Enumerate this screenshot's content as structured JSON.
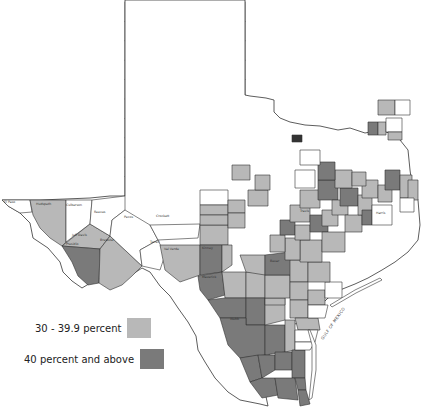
{
  "map": {
    "region": "Texas",
    "unit": "counties",
    "colors": {
      "none": "#ffffff",
      "mid": "#b8b8b8",
      "high": "#7a7a7a",
      "border": "#333333"
    },
    "water_label": "GULF OF MEXICO",
    "panhandle_grid": [
      [
        "Dallam",
        "Sherman",
        "Hansford",
        "Ochiltree",
        "Lipscomb"
      ],
      [
        "Hartley",
        "Moore",
        "Hutchinson",
        "Roberts",
        "Hemphill"
      ],
      [
        "Oldham",
        "Potter",
        "Carson",
        "Gray",
        "Wheeler"
      ],
      [
        "Deaf Smith",
        "Randall",
        "Armstrong",
        "Donley",
        "Collingsworth"
      ],
      [
        "Parmer",
        "Castro",
        "Swisher",
        "Briscoe",
        "Hall",
        "Childress"
      ],
      [
        "Bailey",
        "Lamb",
        "Hale",
        "Floyd",
        "Motley",
        "Cottle"
      ],
      [
        "Cochran",
        "Hockley",
        "Lubbock",
        "Crosby",
        "Dickens",
        "King",
        "Knox"
      ],
      [
        "Yoakum",
        "Terry",
        "Lynn",
        "Garza",
        "Kent",
        "Stonewall",
        "Haskell"
      ],
      [
        "Gaines",
        "Dawson",
        "Borden",
        "Scurry",
        "Fisher",
        "Jones",
        "Shackelford",
        "Stephens"
      ],
      [
        "Andrews",
        "Martin",
        "Howard",
        "Mitchell",
        "Nolan",
        "Taylor",
        "Callahan",
        "Eastland"
      ]
    ],
    "labeled_counties": [
      "El Paso",
      "Hudspeth",
      "Culberson",
      "Jeff Davis",
      "Presidio",
      "Brewster",
      "Reeves",
      "Pecos",
      "Terrell",
      "Crockett",
      "Val Verde",
      "Edwards",
      "Kinney",
      "Uvalde",
      "Maverick",
      "Zavala",
      "Dimmit",
      "Webb",
      "La Salle",
      "Zapata",
      "Jim Hogg",
      "Starr",
      "Hidalgo",
      "Cameron",
      "Willacy",
      "Kenedy",
      "Brooks",
      "Duval",
      "Jim Wells",
      "Kleberg",
      "Nueces",
      "San Patricio",
      "Frio",
      "Medina",
      "Bexar",
      "Atascosa",
      "McMullen",
      "Live Oak",
      "Bee",
      "Goliad",
      "Karnes",
      "Wilson",
      "Gonzales",
      "DeWitt",
      "Victoria",
      "Calhoun",
      "Refugio",
      "Aransas",
      "Jackson",
      "Matagorda",
      "Wharton",
      "Brazoria",
      "Galveston",
      "Harris",
      "Fort Bend",
      "Austin",
      "Waller",
      "Montgomery",
      "Liberty",
      "Chambers",
      "Jefferson",
      "Orange",
      "Hardin",
      "Newton",
      "Jasper",
      "Tyler",
      "Polk",
      "San Jacinto",
      "Walker",
      "Grimes",
      "Brazos",
      "Burleson",
      "Washington",
      "Lee",
      "Fayette",
      "Bastrop",
      "Caldwell",
      "Travis",
      "Hays",
      "Comal",
      "Guadalupe",
      "Kendall",
      "Kerr",
      "Bandera",
      "Real",
      "Sutton",
      "Schleicher",
      "Kimble",
      "Menard",
      "Mason",
      "Llano",
      "Burnet",
      "Williamson",
      "Milam",
      "Bell",
      "Coryell",
      "McLennan",
      "Falls",
      "Robertson",
      "Limestone",
      "Freestone",
      "Leon",
      "Madison",
      "Houston",
      "Trinity",
      "Angelina",
      "Nacogdoches",
      "San Augustine",
      "Sabine",
      "Shelby",
      "Panola",
      "Rusk",
      "Cherokee",
      "Anderson",
      "Henderson",
      "Smith",
      "Gregg",
      "Harrison",
      "Marion",
      "Cass",
      "Bowie",
      "Red River",
      "Lamar",
      "Fannin",
      "Grayson",
      "Cooke",
      "Montague",
      "Clay",
      "Wichita",
      "Wilbarger",
      "Hardeman",
      "Foard",
      "Baylor",
      "Archer",
      "Jack",
      "Wise",
      "Denton",
      "Collin",
      "Hunt",
      "Delta",
      "Hopkins",
      "Franklin",
      "Titus",
      "Morris",
      "Camp",
      "Upshur",
      "Wood",
      "Rains",
      "Van Zandt",
      "Kaufman",
      "Rockwall",
      "Dallas",
      "Tarrant",
      "Parker",
      "Palo Pinto",
      "Young",
      "Throckmorton",
      "Erath",
      "Hood",
      "Johnson",
      "Ellis",
      "Navarro",
      "Hill",
      "Bosque",
      "Somervell",
      "Comanche",
      "Brown",
      "Coleman",
      "Runnels",
      "Coke",
      "Sterling",
      "Glasscock",
      "Midland",
      "Ector",
      "Winkler",
      "Loving",
      "Ward",
      "Crane",
      "Upton",
      "Reagan",
      "Irion",
      "Tom Green",
      "Concho",
      "McCulloch",
      "San Saba",
      "Mills",
      "Hamilton",
      "Lampasas"
    ],
    "shaded_mid": [
      "Hudspeth",
      "Jeff Davis",
      "Brewster",
      "Val Verde",
      "Lamb",
      "Floyd",
      "Motley",
      "Cottle",
      "Collingsworth",
      "Cochran",
      "Knox",
      "Lynn",
      "Fisher",
      "Martin",
      "Schleicher",
      "Sutton",
      "Menard",
      "Kimble",
      "Crockett",
      "Uvalde",
      "Zavala",
      "Frio",
      "Medina",
      "Kenedy",
      "Brooks",
      "San Patricio",
      "Atascosa",
      "Gonzales",
      "Caldwell",
      "Guadalupe",
      "Bastrop",
      "Lee",
      "Burleson",
      "Robertson",
      "Falls",
      "Milam",
      "Williamson",
      "Travis",
      "Hays",
      "Comal",
      "DeWitt",
      "Karnes",
      "Wilson",
      "Fayette",
      "Washington",
      "Grimes",
      "Walker",
      "San Jacinto",
      "Madison",
      "Polk",
      "Tyler",
      "Jasper",
      "Newton",
      "Hardin",
      "Red River",
      "Bowie",
      "Morris",
      "Titus",
      "Live Oak",
      "Bee",
      "Goliad",
      "McMullen"
    ],
    "shaded_high": [
      "Presidio",
      "Maverick",
      "Kinney",
      "Dimmit",
      "Webb",
      "La Salle",
      "Zapata",
      "Jim Hogg",
      "Starr",
      "Hidalgo",
      "Cameron",
      "Willacy",
      "Duval",
      "Jim Wells",
      "Bexar",
      "Brazos",
      "Milam",
      "Bastrop",
      "Falls",
      "Cass",
      "Marion",
      "Waller",
      "Harris",
      "Hays"
    ]
  },
  "legend": {
    "items": [
      {
        "label": "30 - 39.9 percent",
        "color": "#b8b8b8"
      },
      {
        "label": "40 percent and above",
        "color": "#7a7a7a"
      }
    ]
  }
}
